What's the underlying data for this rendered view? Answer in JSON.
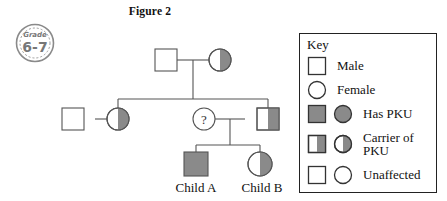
{
  "figure": {
    "title": "Figure 2"
  },
  "grade_stamp": {
    "label": "Grade",
    "value": "6-7"
  },
  "colors": {
    "affected_fill": "#8a8a8a",
    "unaffected_fill": "#ffffff",
    "stroke": "#555555",
    "key_border": "#222222",
    "text": "#111111"
  },
  "key": {
    "title": "Key",
    "rows": [
      {
        "id": "male",
        "label": "Male",
        "square": "unaffected",
        "circle": null
      },
      {
        "id": "female",
        "label": "Female",
        "square": null,
        "circle": "unaffected"
      },
      {
        "id": "has-pku",
        "label": "Has PKU",
        "square": "affected",
        "circle": "affected"
      },
      {
        "id": "carrier-of-pku",
        "label": "Carrier of PKU",
        "square": "carrier",
        "circle": "carrier"
      },
      {
        "id": "unaffected",
        "label": "Unaffected",
        "square": "unaffected",
        "circle": "unaffected"
      }
    ]
  },
  "pedigree": {
    "individuals": [
      {
        "id": "i1",
        "name": "grandfather",
        "sex": "male",
        "status": "unaffected",
        "label": ""
      },
      {
        "id": "i2",
        "name": "grandmother",
        "sex": "female",
        "status": "carrier",
        "label": ""
      },
      {
        "id": "ii1",
        "name": "uncle-by-marriage",
        "sex": "male",
        "status": "unaffected",
        "label": ""
      },
      {
        "id": "ii2",
        "name": "mother-generation-female",
        "sex": "female",
        "status": "carrier",
        "label": ""
      },
      {
        "id": "ii3",
        "name": "mother-unknown",
        "sex": "female",
        "status": "unknown",
        "label": "?"
      },
      {
        "id": "ii4",
        "name": "father",
        "sex": "male",
        "status": "carrier",
        "label": ""
      },
      {
        "id": "iii1",
        "name": "child-a",
        "sex": "male",
        "status": "affected",
        "label": "Child A"
      },
      {
        "id": "iii2",
        "name": "child-b",
        "sex": "female",
        "status": "carrier",
        "label": "Child B"
      }
    ],
    "child_labels": {
      "child_a": "Child A",
      "child_b": "Child B"
    }
  }
}
